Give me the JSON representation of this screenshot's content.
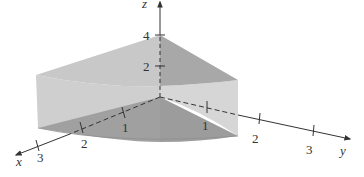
{
  "figure": {
    "type": "3d-solid-wedge",
    "axes": {
      "x": {
        "label": "x",
        "ticks": [
          "1",
          "2",
          "3"
        ]
      },
      "y": {
        "label": "y",
        "ticks": [
          "1",
          "2",
          "3"
        ]
      },
      "z": {
        "label": "z",
        "ticks": [
          "2",
          "4"
        ]
      }
    },
    "colors": {
      "background": "#ffffff",
      "axis": "#333333",
      "face_light": "#d4d4d4",
      "face_mid": "#bdbdbd",
      "face_dark": "#a3a3a3",
      "face_darker": "#9a9a9a"
    }
  }
}
